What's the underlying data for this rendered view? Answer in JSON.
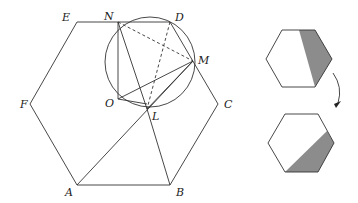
{
  "figure": {
    "main": {
      "hexagon": {
        "vertices": {
          "A": [
            77,
            185
          ],
          "B": [
            170,
            185
          ],
          "C": [
            218,
            104
          ],
          "D": [
            170,
            22
          ],
          "E": [
            77,
            22
          ],
          "F": [
            30,
            104
          ]
        }
      },
      "circle": {
        "cx": 150,
        "cy": 62,
        "r": 45
      },
      "points": {
        "N": [
          118,
          22
        ],
        "M": [
          193,
          61
        ],
        "O": [
          118,
          99
        ],
        "L": [
          147,
          109
        ]
      },
      "labels": {
        "A": "A",
        "B": "B",
        "C": "C",
        "D": "D",
        "E": "E",
        "F": "F",
        "N": "N",
        "M": "M",
        "O": "O",
        "L": "L"
      }
    },
    "side": {
      "top_hexagon_shaded": "right portion shaded gray",
      "bottom_hexagon_shaded": "lower-right portion shaded gray",
      "arrow": "curved arrow pointing down from top hexagon to bottom hexagon"
    },
    "colors": {
      "stroke": "#333333",
      "shade": "#8c8c8c",
      "background": "#ffffff"
    }
  }
}
